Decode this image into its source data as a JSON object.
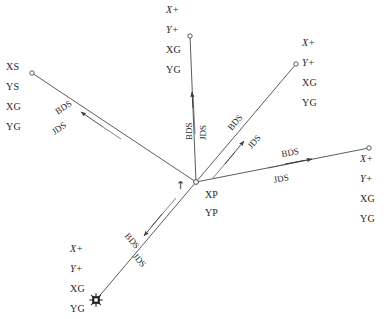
{
  "diagram": {
    "background_color": "#ffffff",
    "line_color": "#4a4a4a",
    "text_color": "#262626",
    "center": {
      "name": "center-node",
      "x": 196,
      "y": 182,
      "marker": "open-circle",
      "labels": [
        "XP",
        "YP"
      ],
      "indicator_icon": "up-arrow-icon",
      "indicator_glyph": "↑"
    },
    "edge_labels": {
      "above": "BDS",
      "below": "JDS"
    },
    "rays": [
      {
        "id": "ray-upper-left",
        "direction": "upper-left",
        "x1": 196,
        "y1": 182,
        "x2": 32,
        "y2": 73,
        "endpoint_marker": "open-circle",
        "arrow_direction": "outward",
        "labels": [
          "XS",
          "YS",
          "XG",
          "YG"
        ],
        "label_styles": [
          "upright",
          "upright",
          "upright",
          "upright"
        ],
        "label_x": 6,
        "label_y": 62,
        "bds": "BDS",
        "jds": "JDS",
        "double_line": true
      },
      {
        "id": "ray-top",
        "direction": "top",
        "x1": 196,
        "y1": 182,
        "x2": 190,
        "y2": 36,
        "endpoint_marker": "open-circle",
        "arrow_direction": "outward",
        "labels": [
          "X+",
          "Y+",
          "XG",
          "YG"
        ],
        "label_styles": [
          "italic",
          "italic",
          "upright",
          "upright"
        ],
        "label_x": 166,
        "label_y": 5,
        "bds": "BDS",
        "jds": "JDS",
        "double_line": true
      },
      {
        "id": "ray-upper-right",
        "direction": "upper-right",
        "x1": 196,
        "y1": 182,
        "x2": 296,
        "y2": 64,
        "endpoint_marker": "open-circle",
        "arrow_direction": "outward",
        "labels": [
          "X+",
          "Y+",
          "XG",
          "YG"
        ],
        "label_styles": [
          "italic",
          "italic",
          "upright",
          "upright"
        ],
        "label_x": 302,
        "label_y": 38,
        "bds": "BDS",
        "jds": "JDS",
        "double_line": true
      },
      {
        "id": "ray-right",
        "direction": "right",
        "x1": 196,
        "y1": 182,
        "x2": 369,
        "y2": 148,
        "endpoint_marker": "open-circle",
        "arrow_direction": "outward",
        "labels": [
          "X+",
          "Y+",
          "XG",
          "YG"
        ],
        "label_styles": [
          "italic",
          "italic",
          "upright",
          "upright"
        ],
        "label_x": 360,
        "label_y": 154,
        "bds": "BDS",
        "jds": "JDS",
        "double_line": true
      },
      {
        "id": "ray-lower-left",
        "direction": "lower-left",
        "x1": 196,
        "y1": 182,
        "x2": 96,
        "y2": 300,
        "endpoint_marker": "filled-star",
        "arrow_direction": "outward",
        "labels": [
          "X+",
          "Y+",
          "XG",
          "YG"
        ],
        "label_styles": [
          "italic",
          "italic",
          "upright",
          "upright"
        ],
        "label_x": 70,
        "label_y": 244,
        "bds": "BDS",
        "jds": "JDS",
        "double_line": true
      }
    ]
  }
}
